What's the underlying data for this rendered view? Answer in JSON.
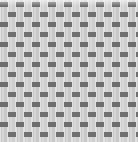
{
  "image": {
    "subject": "woven basket-weave fabric texture",
    "width": 138,
    "height": 142,
    "colors": {
      "background": "#ffffff",
      "light_strand": "#c8c8c8",
      "light_strand_highlight": "#d6d6d6",
      "dark_block": "#6e6e6e",
      "gap": "#e2e2e2"
    },
    "pattern": {
      "cell_width": 16,
      "row_height": 10,
      "dark_block_width": 8,
      "dark_block_height": 5,
      "row_offset": 8
    }
  }
}
